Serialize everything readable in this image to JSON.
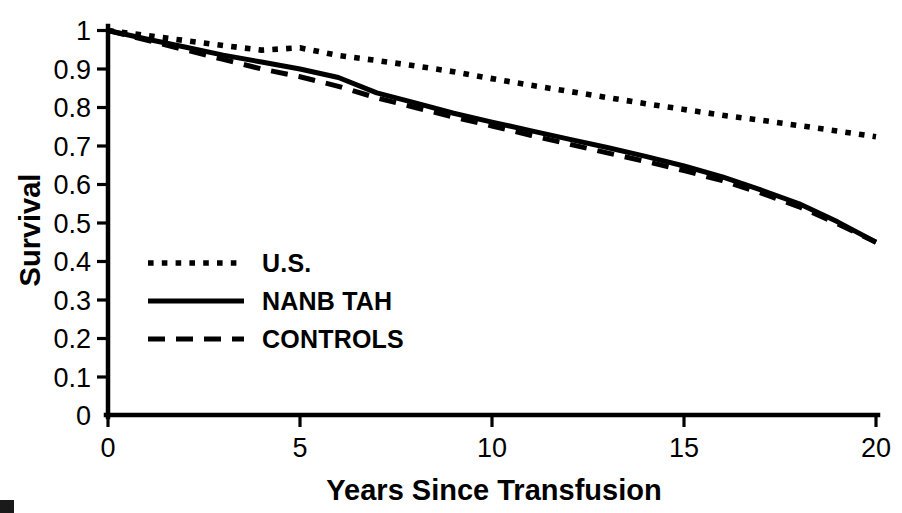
{
  "chart_data": {
    "type": "line",
    "title": "",
    "xlabel": "Years Since Transfusion",
    "ylabel": "Survival",
    "xlim": [
      0,
      20
    ],
    "ylim": [
      0,
      1
    ],
    "grid": false,
    "legend_position": "inside-left",
    "x_ticks": [
      "0",
      "5",
      "10",
      "15",
      "20"
    ],
    "x_tick_values": [
      0,
      5,
      10,
      15,
      20
    ],
    "y_ticks": [
      "0",
      "0.1",
      "0.2",
      "0.3",
      "0.4",
      "0.5",
      "0.6",
      "0.7",
      "0.8",
      "0.9",
      "1"
    ],
    "y_tick_values": [
      0,
      0.1,
      0.2,
      0.3,
      0.4,
      0.5,
      0.6,
      0.7,
      0.8,
      0.9,
      1
    ],
    "x": [
      0,
      1,
      2,
      3,
      4,
      5,
      6,
      7,
      8,
      9,
      10,
      11,
      12,
      13,
      14,
      15,
      16,
      17,
      18,
      19,
      20
    ],
    "series": [
      {
        "name": "U.S.",
        "style": "dotted",
        "values": [
          1.0,
          0.987,
          0.974,
          0.961,
          0.949,
          0.955,
          0.935,
          0.922,
          0.908,
          0.893,
          0.875,
          0.858,
          0.842,
          0.826,
          0.81,
          0.795,
          0.78,
          0.767,
          0.753,
          0.739,
          0.724
        ]
      },
      {
        "name": "NANB TAH",
        "style": "solid",
        "values": [
          1.0,
          0.978,
          0.957,
          0.936,
          0.918,
          0.9,
          0.878,
          0.838,
          0.812,
          0.785,
          0.762,
          0.74,
          0.718,
          0.696,
          0.673,
          0.648,
          0.62,
          0.586,
          0.55,
          0.503,
          0.45
        ]
      },
      {
        "name": "CONTROLS",
        "style": "dashed",
        "values": [
          1.0,
          0.975,
          0.95,
          0.925,
          0.9,
          0.88,
          0.855,
          0.825,
          0.8,
          0.775,
          0.752,
          0.728,
          0.705,
          0.682,
          0.66,
          0.636,
          0.61,
          0.578,
          0.542,
          0.498,
          0.45
        ]
      }
    ],
    "legend": [
      {
        "label": "U.S.",
        "style": "dotted"
      },
      {
        "label": "NANB TAH",
        "style": "solid"
      },
      {
        "label": "CONTROLS",
        "style": "dashed"
      }
    ],
    "colors": {
      "line": "#000000",
      "axis": "#000000",
      "background": "#ffffff"
    }
  }
}
